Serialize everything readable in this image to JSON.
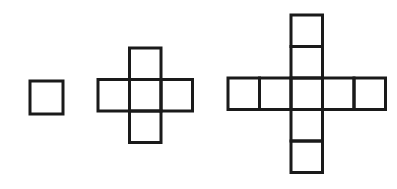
{
  "diagram": {
    "title": "",
    "stroke_color": "#1a1a1a",
    "background": "#ffffff",
    "figures": [
      {
        "name": "figure-1",
        "square_count": 1,
        "cells": [
          [
            0,
            0
          ]
        ],
        "origin": [
          30,
          81
        ],
        "cell_size": 33
      },
      {
        "name": "figure-2",
        "square_count": 5,
        "cells": [
          [
            1,
            0
          ],
          [
            0,
            1
          ],
          [
            1,
            1
          ],
          [
            2,
            1
          ],
          [
            1,
            2
          ]
        ],
        "origin": [
          98,
          48
        ],
        "cell_size": 31.5
      },
      {
        "name": "figure-3",
        "square_count": 9,
        "cells": [
          [
            2,
            0
          ],
          [
            2,
            1
          ],
          [
            0,
            2
          ],
          [
            1,
            2
          ],
          [
            2,
            2
          ],
          [
            3,
            2
          ],
          [
            4,
            2
          ],
          [
            2,
            3
          ],
          [
            2,
            4
          ]
        ],
        "origin": [
          228,
          15
        ],
        "cell_size": 31.5
      }
    ]
  }
}
